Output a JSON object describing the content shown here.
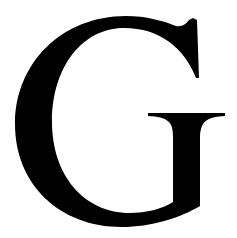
{
  "glyph": {
    "character": "G",
    "color": "#000000",
    "background": "#ffffff"
  }
}
